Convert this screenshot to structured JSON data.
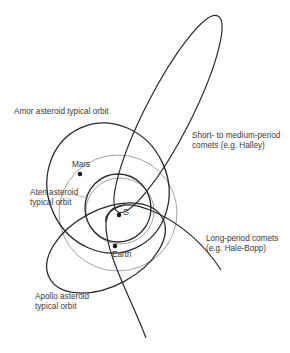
{
  "diagram": {
    "type": "solar-system-orbits",
    "sun_label": "S",
    "bodies": [
      {
        "name": "Mars",
        "label": "Mars"
      },
      {
        "name": "Earth",
        "label": "Earth"
      }
    ],
    "labels": {
      "amor": "Amor asteroid typical orbit",
      "halley_line1": "Short- to medium-period",
      "halley_line2": "comets (e.g. Halley)",
      "aten_line1": "Aten asteroid",
      "aten_line2": "typical orbit",
      "long_line1": "Long-period comets",
      "long_line2": "(e.g. Hale-Bopp)",
      "apollo_line1": "Apollo asteroid",
      "apollo_line2": "typical orbit"
    },
    "colors": {
      "major_orbit": "#2a2a2a",
      "planet_orbit": "#8a8a8a",
      "text": "#3a3a3a",
      "background": "#ffffff"
    }
  }
}
